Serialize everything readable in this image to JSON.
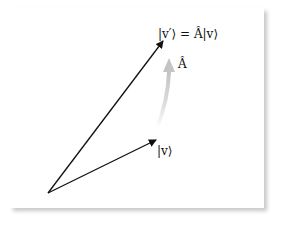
{
  "diagram": {
    "type": "vector-transformation",
    "labels": {
      "transformed_vector": "|v′⟩ = Â|v⟩",
      "operator": "Â",
      "original_vector": "|v⟩"
    },
    "colors": {
      "vector": "#111111",
      "operator_arrow": "#c8c8c8",
      "background": "#ffffff"
    },
    "points": {
      "origin": [
        48,
        193
      ],
      "v_tip": [
        157,
        139
      ],
      "v_prime_tip": [
        164,
        40
      ]
    }
  }
}
